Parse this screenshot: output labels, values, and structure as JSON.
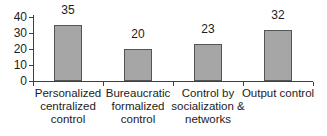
{
  "chart_data": {
    "type": "bar",
    "categories": [
      "Personalized\ncentralized\ncontrol",
      "Bureaucratic\nformalized\ncontrol",
      "Control by\nsocialization &\nnetworks",
      "Output control"
    ],
    "values": [
      35,
      20,
      23,
      32
    ],
    "data_labels": [
      "35",
      "20",
      "23",
      "32"
    ],
    "yticks": [
      0,
      10,
      20,
      30,
      40
    ],
    "ytick_labels": [
      "0",
      "10",
      "20",
      "30",
      "40"
    ],
    "ylim": [
      0,
      40
    ],
    "title": "",
    "xlabel": "",
    "ylabel": "",
    "grid": false,
    "legend_position": "none",
    "colors": {
      "bar_fill": "#a6a6a6",
      "bar_border": "#545454",
      "axis": "#3f3f3f",
      "text": "#1c1c1c",
      "background": "#ffffff"
    }
  }
}
